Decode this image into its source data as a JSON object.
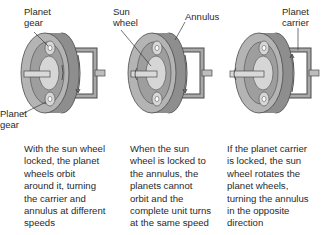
{
  "panels": [
    {
      "labels": [
        {
          "line1": "Planet",
          "line2": "gear"
        },
        {
          "line1": "Planet",
          "line2": "gear"
        }
      ],
      "caption": "With the sun wheel\nlocked, the planet\nwheels orbit\naround it, turning\nthe carrier and\nannulus at different\nspeeds"
    },
    {
      "labels": [
        {
          "line1": "Sun",
          "line2": "wheel"
        },
        {
          "line1": "Annulus",
          "line2": ""
        }
      ],
      "caption": "When the sun\nwheel is locked to\nthe annulus, the\nplanets cannot\norbit and the\ncomplete unit turns\nat the same speed"
    },
    {
      "labels": [
        {
          "line1": "Planet",
          "line2": "carrier"
        }
      ],
      "caption": "If the planet carrier\nis locked, the sun\nwheel rotates the\nplanet wheels,\nturning the annulus\nin the opposite\ndirection"
    }
  ],
  "colors": {
    "housing_dark": "#8e8e8e",
    "housing_mid": "#b4b4b4",
    "housing_light": "#d6d6d6",
    "carrier": "#9a9a9a",
    "outline": "#4a4a4a",
    "text": "#2a2a2a"
  }
}
